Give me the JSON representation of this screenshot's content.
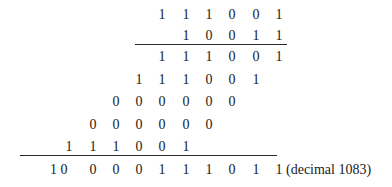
{
  "multiplication": {
    "multiplicand": [
      "1",
      "1",
      "1",
      "0",
      "0",
      "1"
    ],
    "multiplier": [
      "1",
      "0",
      "0",
      "1",
      "1"
    ],
    "partial_products": [
      [
        "1",
        "1",
        "1",
        "0",
        "0",
        "1"
      ],
      [
        "1",
        "1",
        "1",
        "0",
        "0",
        "1"
      ],
      [
        "0",
        "0",
        "0",
        "0",
        "0",
        "0"
      ],
      [
        "0",
        "0",
        "0",
        "0",
        "0",
        "0"
      ],
      [
        "1",
        "1",
        "1",
        "0",
        "0",
        "1"
      ]
    ],
    "result_lead": "1 0",
    "result": [
      "0",
      "0",
      "0",
      "1",
      "1",
      "1",
      "0",
      "1",
      "1"
    ],
    "decimal_note": "(decimal 1083)"
  }
}
